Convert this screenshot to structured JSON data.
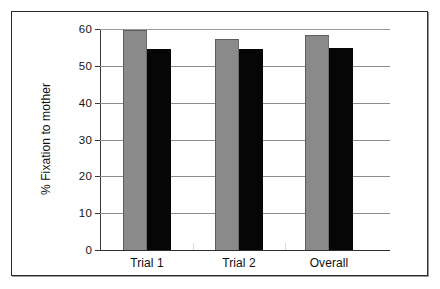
{
  "figure": {
    "frame_border_color": "#2b2b2b",
    "background_color": "#ffffff"
  },
  "chart_data": {
    "type": "bar",
    "title": "",
    "subtitle": "",
    "xlabel": "",
    "ylabel": "% Fixation to mother",
    "categories": [
      "Trial 1",
      "Trial 2",
      "Overall"
    ],
    "series": [
      {
        "name": "series-1",
        "color": "#8a8a8a",
        "values": [
          59.8,
          57.2,
          58.5
        ]
      },
      {
        "name": "series-2",
        "color": "#060606",
        "values": [
          54.5,
          54.7,
          54.9
        ]
      }
    ],
    "ylim": [
      0,
      60
    ],
    "yticks": [
      0,
      10,
      20,
      30,
      40,
      50,
      60
    ],
    "ytick_labels": [
      "0",
      "10",
      "20",
      "30",
      "40",
      "50",
      "60"
    ],
    "grid": true,
    "grid_axis": "y",
    "legend": false,
    "legend_position": "none",
    "bar_order": "grouped",
    "annotations": []
  }
}
